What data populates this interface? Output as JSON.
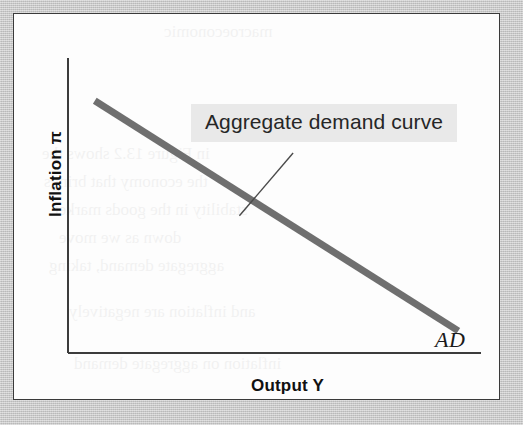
{
  "figure": {
    "panel_background": "#fdfdfd",
    "margin_background": "#c9c9c9",
    "border_color": "#3a3a3a"
  },
  "chart_data": {
    "type": "line",
    "title": "",
    "xlabel": "Output Y",
    "ylabel": "Inflation π",
    "grid": false,
    "legend": "none",
    "axis_style": "qualitative-unlabeled",
    "xlim": [
      0,
      1
    ],
    "ylim": [
      0,
      1
    ],
    "xticks": [],
    "yticks": [],
    "series": [
      {
        "name": "AD",
        "label": "AD",
        "description": "Aggregate demand curve",
        "color": "#6f6f6f",
        "line_width_px": 7,
        "points": [
          {
            "x": 0.065,
            "y": 0.855
          },
          {
            "x": 0.945,
            "y": 0.075
          }
        ]
      }
    ],
    "annotations": [
      {
        "text": "Aggregate demand curve",
        "highlight_color": "#e9e9e9",
        "leader_from": {
          "x": 0.545,
          "y": 0.678
        },
        "leader_to": {
          "x": 0.415,
          "y": 0.465
        }
      }
    ]
  },
  "labels": {
    "y_axis": "Inflation π",
    "x_axis": "Output Y",
    "annotation": "Aggregate demand curve",
    "curve_tag": "AD"
  },
  "bleed_through_text": {
    "line1": "macroeconomic",
    "line2": "in Figure 13.2 shows the",
    "line3": "the economy that brings",
    "line4": "stability in the goods market",
    "line5": "down as we move",
    "line6": "aggregate demand, taking",
    "line7": "and inflation are negatively",
    "line8": "inflation on aggregate demand"
  }
}
